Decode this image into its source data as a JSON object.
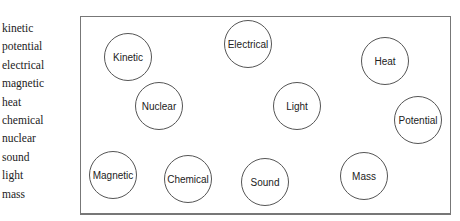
{
  "header": {
    "cut_text": ""
  },
  "word_list": [
    "kinetic",
    "potential",
    "electrical",
    "magnetic",
    "heat",
    "chemical",
    "nuclear",
    "sound",
    "light",
    "mass"
  ],
  "bubbles": [
    {
      "label": "Kinetic",
      "cx": 128,
      "cy": 57
    },
    {
      "label": "Electrical",
      "cx": 248,
      "cy": 44
    },
    {
      "label": "Heat",
      "cx": 385,
      "cy": 61
    },
    {
      "label": "Nuclear",
      "cx": 159,
      "cy": 106
    },
    {
      "label": "Light",
      "cx": 297,
      "cy": 106
    },
    {
      "label": "Potential",
      "cx": 418,
      "cy": 120
    },
    {
      "label": "Magnetic",
      "cx": 113,
      "cy": 175
    },
    {
      "label": "Chemical",
      "cx": 188,
      "cy": 179
    },
    {
      "label": "Sound",
      "cx": 265,
      "cy": 182
    },
    {
      "label": "Mass",
      "cx": 364,
      "cy": 176
    }
  ],
  "colors": {
    "stroke": "#555555",
    "text": "#222222",
    "frame": "#777777"
  }
}
